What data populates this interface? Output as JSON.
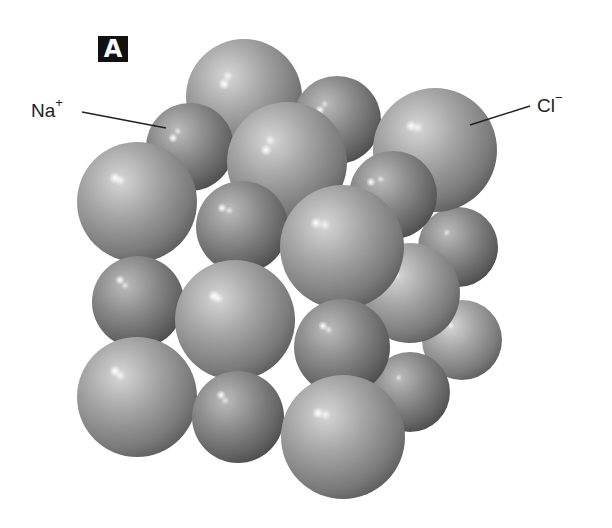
{
  "figure": {
    "panel_label": "A"
  },
  "labels": {
    "sodium": {
      "symbol": "Na",
      "charge": "+"
    },
    "chloride": {
      "symbol": "Cl",
      "charge": "−"
    }
  },
  "colors": {
    "background": "#ffffff",
    "sphere_light": "#c4c4c4",
    "sphere_mid": "#8c8c8c",
    "sphere_dark": "#555555",
    "highlight": "#ffffff",
    "text": "#222222",
    "badge": "#111111"
  }
}
